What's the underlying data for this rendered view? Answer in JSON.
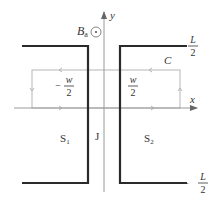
{
  "diagram": {
    "type": "josephson-junction-contour",
    "colors": {
      "conductor": "#2a2a2a",
      "axis": "#9a9a9a",
      "contour": "#b5b5b5",
      "text": "#333333"
    },
    "axes": {
      "x_label": "x",
      "y_label": "y"
    },
    "field": {
      "label_main": "B",
      "label_sub": "a",
      "symbol": "out-of-page"
    },
    "contour": {
      "label": "C"
    },
    "regions": {
      "left": {
        "label_main": "S",
        "label_sub": "1"
      },
      "junction": {
        "label": "J"
      },
      "right": {
        "label_main": "S",
        "label_sub": "2"
      }
    },
    "ticks": {
      "top": {
        "numerator": "L",
        "denominator": "2",
        "sign": ""
      },
      "bottom": {
        "numerator": "L",
        "denominator": "2",
        "sign": "−"
      },
      "left_w": {
        "numerator": "w",
        "denominator": "2",
        "sign": "−"
      },
      "right_w": {
        "numerator": "w",
        "denominator": "2",
        "sign": ""
      }
    }
  }
}
